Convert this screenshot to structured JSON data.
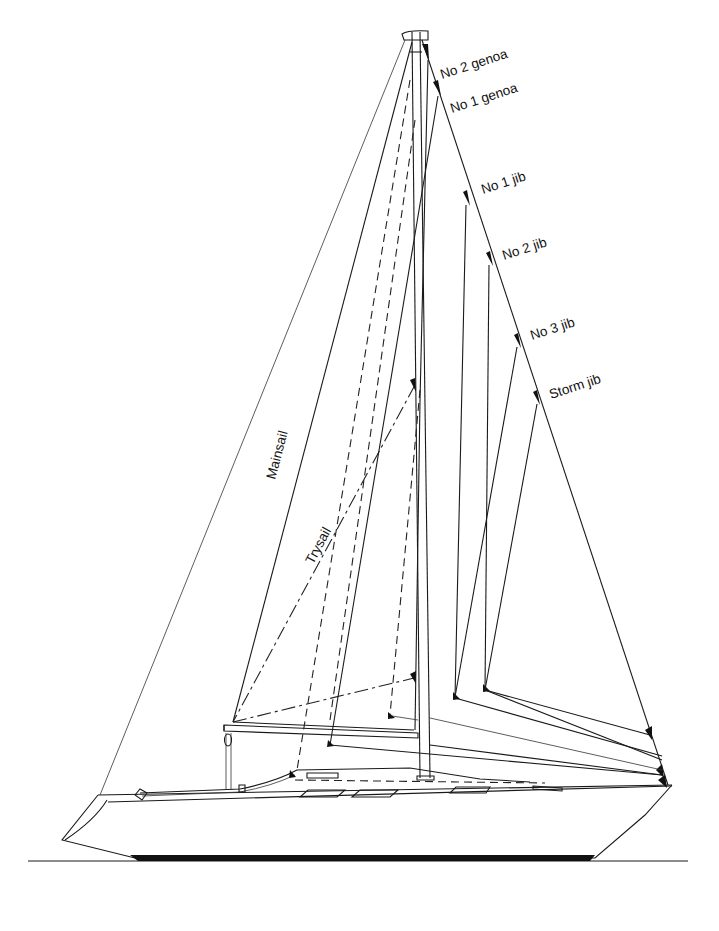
{
  "diagram": {
    "type": "sail plan",
    "labels": {
      "no2_genoa": "No 2 genoa",
      "no1_genoa": "No 1 genoa",
      "no1_jib": "No 1 jib",
      "no2_jib": "No 2 jib",
      "no3_jib": "No 3 jib",
      "storm_jib": "Storm jib",
      "mainsail": "Mainsail",
      "trysail": "Trysail"
    },
    "colors": {
      "line": "#1a1a1a",
      "background": "#ffffff",
      "keel_stripe": "#111111"
    }
  }
}
